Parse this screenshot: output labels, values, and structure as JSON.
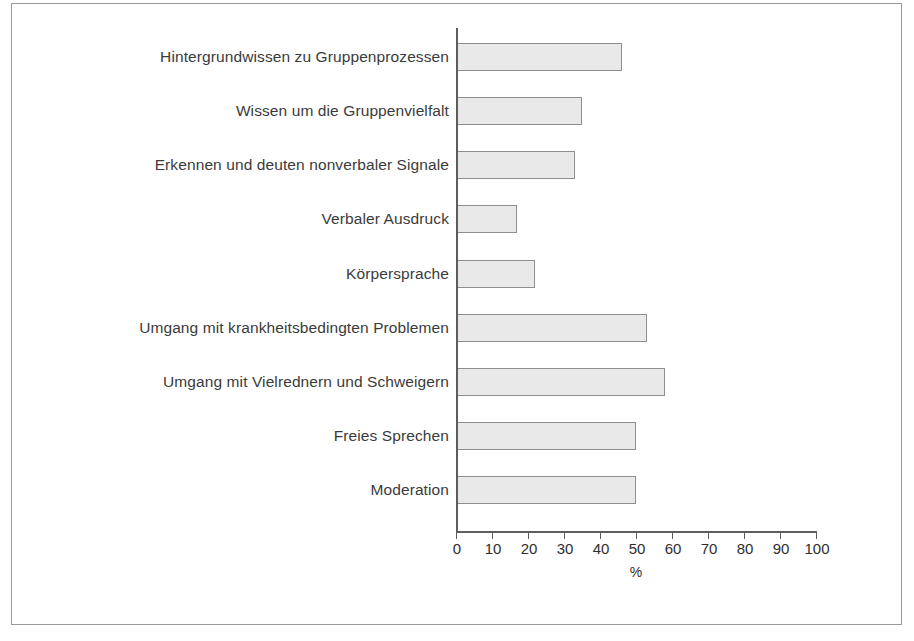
{
  "chart_data": {
    "type": "bar",
    "orientation": "horizontal",
    "title": "",
    "subtitle": "",
    "xlabel": "%",
    "ylabel": "",
    "xlim": [
      0,
      100
    ],
    "xticks": [
      0,
      10,
      20,
      30,
      40,
      50,
      60,
      70,
      80,
      90,
      100
    ],
    "xtick_labels": [
      "0",
      "10",
      "20",
      "30",
      "40",
      "50",
      "60",
      "70",
      "80",
      "90",
      "100"
    ],
    "grid": false,
    "legend": null,
    "bar_fill_color": "#e9e9e9",
    "bar_border_color": "#8e8e8e",
    "axis_color": "#5d5d5d",
    "frame_color": "#9a9a9a",
    "categories": [
      "Hintergrundwissen zu Gruppenprozessen",
      "Wissen um die Gruppenvielfalt",
      "Erkennen und deuten nonverbaler Signale",
      "Verbaler Ausdruck",
      "Körpersprache",
      "Umgang mit krankheitsbedingten Problemen",
      "Umgang mit Vielrednern und Schweigern",
      "Freies Sprechen",
      "Moderation"
    ],
    "values": [
      46,
      35,
      33,
      17,
      22,
      53,
      58,
      50,
      50
    ]
  }
}
